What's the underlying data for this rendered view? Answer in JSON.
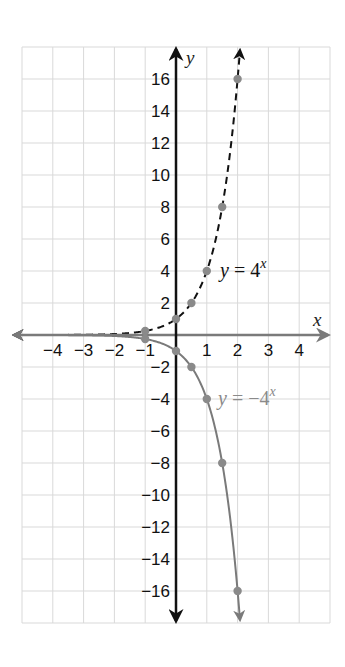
{
  "chart_data": {
    "type": "line",
    "title": "",
    "xlabel": "x",
    "ylabel": "y",
    "xlim": [
      -5,
      5
    ],
    "ylim": [
      -18,
      18
    ],
    "grid": true,
    "x_ticks": [
      -4,
      -3,
      -2,
      -1,
      1,
      2,
      3,
      4
    ],
    "y_ticks": [
      16,
      14,
      12,
      10,
      8,
      6,
      4,
      2,
      -2,
      -4,
      -6,
      -8,
      -10,
      -12,
      -14,
      -16
    ],
    "series": [
      {
        "name": "y = 4^x",
        "label_prefix": "y",
        "label_eq": " = 4",
        "label_exp": "x",
        "style": "dashed",
        "color": "#111111",
        "points": [
          [
            -1,
            0.25
          ],
          [
            0,
            1
          ],
          [
            0.5,
            2
          ],
          [
            1,
            4
          ],
          [
            1.5,
            8
          ],
          [
            2,
            16
          ]
        ]
      },
      {
        "name": "y = -4^x",
        "label_prefix": "y",
        "label_eq": " = −4",
        "label_exp": "x",
        "style": "solid",
        "color": "#7a7a7a",
        "points": [
          [
            -1,
            -0.25
          ],
          [
            0,
            -1
          ],
          [
            0.5,
            -2
          ],
          [
            1,
            -4
          ],
          [
            1.5,
            -8
          ],
          [
            2,
            -16
          ]
        ]
      }
    ],
    "colors": {
      "grid": "#d9d9d9",
      "y_axis": "#111111",
      "x_axis": "#7a7a7a",
      "dots": "#8a8a8a"
    }
  }
}
